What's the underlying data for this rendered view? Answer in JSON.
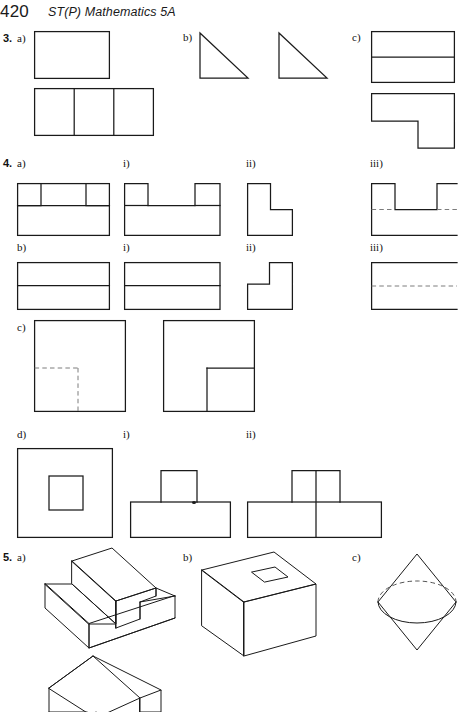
{
  "page": {
    "folio": "420",
    "book_title": "ST(P) Mathematics 5A",
    "width": 457,
    "height": 712,
    "background": "#ffffff",
    "ink": "#1a1a1a",
    "hidden_edge_color": "#7c7c7c"
  },
  "questions": [
    {
      "number": "3.",
      "parts": [
        {
          "label": "a)",
          "figures": [
            {
              "name": "plan-rectangle",
              "type": "rectangle",
              "description": "plain rectangle"
            },
            {
              "name": "elevation-three-panel-rectangle",
              "type": "rectangle-divided",
              "divisions": 2,
              "description": "rectangle divided into three equal vertical panels"
            }
          ]
        },
        {
          "label": "b)",
          "figures": [
            {
              "name": "right-triangle-left",
              "type": "right-triangle",
              "description": "right-angled triangle, right angle at top-left"
            },
            {
              "name": "right-triangle-right",
              "type": "right-triangle",
              "description": "right-angled triangle, right angle at top-left"
            }
          ]
        },
        {
          "label": "c)",
          "figures": [
            {
              "name": "rectangle-split-horizontal",
              "type": "rectangle-divided",
              "divisions": 1,
              "description": "rectangle with one horizontal dividing line"
            },
            {
              "name": "l-shape-step",
              "type": "l-shape",
              "description": "L-shaped outline with step at bottom right"
            }
          ]
        }
      ]
    },
    {
      "number": "4.",
      "parts": [
        {
          "label": "a)",
          "figures": [
            {
              "name": "front-elevation-two-notches",
              "type": "rectangle-with-two-inner-squares",
              "description": "rectangle with two small squares drawn at top corners area"
            }
          ]
        },
        {
          "label": "i)",
          "figures": [
            {
              "name": "plan-two-towers",
              "type": "outline-with-two-projections",
              "description": "U-like outline with two raised blocks"
            }
          ]
        },
        {
          "label": "ii)",
          "figures": [
            {
              "name": "side-elevation-l-shape",
              "type": "l-shape",
              "description": "L-shape, notch at bottom right"
            }
          ]
        },
        {
          "label": "iii)",
          "figures": [
            {
              "name": "end-elevation-two-towers-hidden",
              "type": "outline-with-two-projections-dashed",
              "description": "two raised blocks with hidden dashed line, runs off the right edge"
            }
          ]
        },
        {
          "label": "b)",
          "figures": [
            {
              "name": "elevation-split-rectangle",
              "type": "rectangle-divided",
              "divisions": 1,
              "description": "rectangle with a single horizontal dividing line"
            }
          ]
        },
        {
          "label": "i)",
          "figures": [
            {
              "name": "plan-split-rectangle",
              "type": "rectangle-divided",
              "divisions": 1,
              "description": "rectangle with a single horizontal dividing line"
            }
          ]
        },
        {
          "label": "ii)",
          "figures": [
            {
              "name": "side-elevation-step-shape",
              "type": "l-shape-rotated",
              "description": "step shape, notch at top left"
            }
          ]
        },
        {
          "label": "iii)",
          "figures": [
            {
              "name": "end-elevation-hidden-line",
              "type": "rectangle-dashed-centre",
              "description": "rectangle with dashed horizontal centre line, runs off the right edge"
            }
          ]
        },
        {
          "label": "c)",
          "figures": [
            {
              "name": "plan-square-hidden-quadrant",
              "type": "square-dashed-quadrant",
              "description": "square with dashed lines marking a bottom-left quadrant"
            },
            {
              "name": "plan-square-solid-quadrant",
              "type": "square-solid-quadrant",
              "description": "square with solid lines marking a bottom-right quadrant"
            }
          ]
        },
        {
          "label": "d)",
          "figures": [
            {
              "name": "plan-square-in-square",
              "type": "square-in-square",
              "description": "large square containing a smaller centred square"
            }
          ]
        },
        {
          "label": "i)",
          "figures": [
            {
              "name": "elevation-tower-on-base",
              "type": "tee-shape",
              "description": "tall block standing on a wide base block"
            }
          ]
        },
        {
          "label": "ii)",
          "figures": [
            {
              "name": "elevation-tower-on-base-divided",
              "type": "tee-shape-divided",
              "description": "tall block on wide base, both split by a vertical line"
            }
          ]
        }
      ]
    },
    {
      "number": "5.",
      "parts": [
        {
          "label": "a)",
          "figures": [
            {
              "name": "solid-two-step-staircase",
              "type": "isometric-solid",
              "description": "isometric drawing of a two-step staircase solid"
            },
            {
              "name": "solid-ridge-prism",
              "type": "isometric-solid",
              "description": "isometric drawing of a ridged prism, cropped by page edge"
            }
          ]
        },
        {
          "label": "b)",
          "figures": [
            {
              "name": "solid-cube-with-square-hole",
              "type": "isometric-solid",
              "description": "isometric cube with a small square hole in the top face"
            }
          ]
        },
        {
          "label": "c)",
          "figures": [
            {
              "name": "solid-bicone",
              "type": "isometric-solid",
              "description": "two cones joined base to base, the join drawn as an ellipse with hidden upper half dashed"
            }
          ]
        }
      ]
    }
  ]
}
